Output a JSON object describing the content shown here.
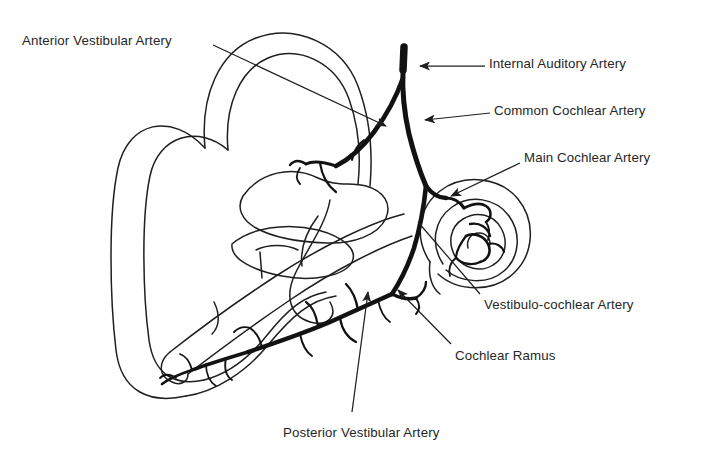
{
  "figure": {
    "background_color": "#ffffff",
    "ink_color": "#1a1a1a",
    "text_color": "#262626",
    "style": "scanned line drawing, black and white"
  },
  "labels": [
    {
      "id": "anterior-vestibular-artery",
      "text": "Anterior Vestibular Artery",
      "x": 22,
      "y": 33,
      "leader": "line from label right edge down-right to arrowhead at artery bend",
      "arrow": true
    },
    {
      "id": "internal-auditory-artery",
      "text": "Internal Auditory Artery",
      "x": 489,
      "y": 56,
      "leader": "horizontal line leftward to arrowhead on top of main trunk",
      "arrow": true
    },
    {
      "id": "common-cochlear-artery",
      "text": "Common Cochlear Artery",
      "x": 494,
      "y": 103,
      "leader": "horizontal line leftward to arrowhead on descending trunk",
      "arrow": true
    },
    {
      "id": "main-cochlear-artery",
      "text": "Main Cochlear Artery",
      "x": 524,
      "y": 150,
      "leader": "line down-left to arrowhead at cochlear vessel junction",
      "arrow": true
    },
    {
      "id": "vestibulo-cochlear-artery",
      "text": "Vestibulo-cochlear Artery",
      "x": 484,
      "y": 297,
      "leader": "long line up-left crossing into cochlea",
      "arrow": false
    },
    {
      "id": "cochlear-ramus",
      "text": "Cochlear Ramus",
      "x": 455,
      "y": 348,
      "leader": "line up-left to arrowhead on ramus branch",
      "arrow": true
    },
    {
      "id": "posterior-vestibular-artery",
      "text": "Posterior Vestibular Artery",
      "x": 283,
      "y": 425,
      "leader": "line upward to arrowhead on posterior branch",
      "arrow": true
    }
  ],
  "structures": [
    {
      "id": "superior-semicircular-canal",
      "kind": "double-outline loop, upper"
    },
    {
      "id": "lateral-semicircular-canal",
      "kind": "double-outline loop, left"
    },
    {
      "id": "posterior-semicircular-canal",
      "kind": "double-outline loop, lower left"
    },
    {
      "id": "vestibule",
      "kind": "central chamber outline"
    },
    {
      "id": "cochlea",
      "kind": "three-turn spiral, right"
    },
    {
      "id": "internal-auditory-canal",
      "kind": "elongated duct running lower-left"
    }
  ],
  "vessels": [
    {
      "id": "main-trunk",
      "kind": "thick black artery descending from top"
    },
    {
      "id": "vestibular-branch",
      "kind": "thick branch to vestibule, upper left"
    },
    {
      "id": "cochlear-branch",
      "kind": "thick branch into cochlear spiral"
    },
    {
      "id": "posterior-branch",
      "kind": "thick branch running down-left with twigs"
    }
  ]
}
